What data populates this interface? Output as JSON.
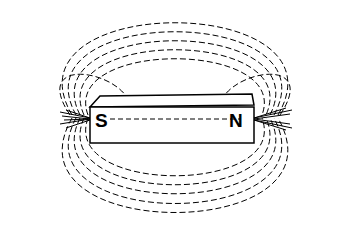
{
  "diagram": {
    "magnet": {
      "south_label": "S",
      "north_label": "N"
    },
    "line_color": "#000000",
    "background": "#ffffff"
  }
}
